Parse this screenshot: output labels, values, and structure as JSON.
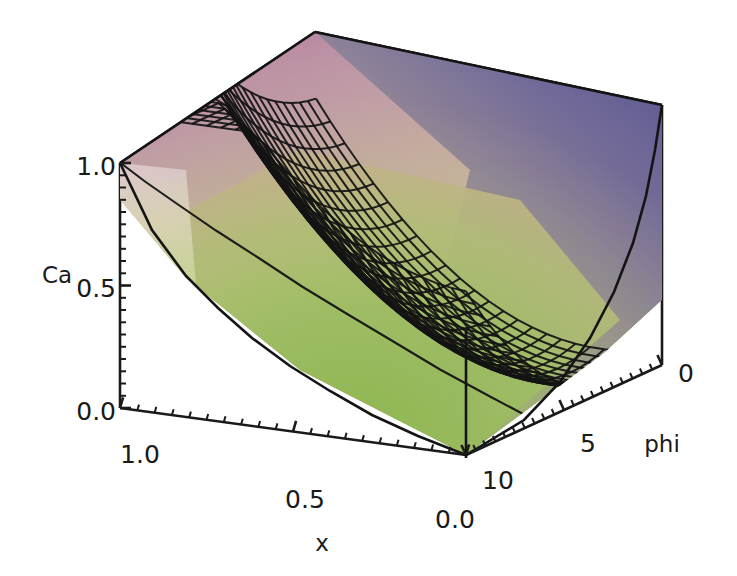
{
  "figure": {
    "background_color": "#ffffff",
    "line_color": "#1a1a1a",
    "mesh_color": "#141414"
  },
  "axes": {
    "vertical": {
      "name": "Ca",
      "label": "Ca",
      "ticks": [
        "1.0",
        "0.5",
        "0.0"
      ],
      "tick_values": [
        1.0,
        0.5,
        0.0
      ],
      "minor_ticks_per_interval": 9
    },
    "depth_left": {
      "name": "x",
      "label": "x",
      "ticks": [
        "1.0",
        "0.5",
        "0.0"
      ],
      "tick_values": [
        1.0,
        0.5,
        0.0
      ],
      "minor_ticks_per_interval": 9
    },
    "depth_right": {
      "name": "phi",
      "label": "phi",
      "ticks": [
        "0",
        "5",
        "10"
      ],
      "tick_values": [
        0,
        5,
        10
      ],
      "minor_ticks_per_interval": 9
    }
  },
  "chart_data": {
    "type": "surface",
    "title": "",
    "xlabel": "x",
    "ylabel": "phi",
    "zlabel": "Ca",
    "xlim": [
      0.0,
      1.0
    ],
    "ylim": [
      0,
      10
    ],
    "zlim": [
      0.0,
      1.2
    ],
    "grid": false,
    "legend": "none",
    "mesh_nx": 24,
    "mesh_ny": 24,
    "colormap": {
      "name": "hue-shift",
      "low": "#a8c662",
      "mid": "#c9a89a",
      "high_back_left": "#b07e9e",
      "high_back_right": "#5c5a96",
      "low_left_edge": "#e6e9c0"
    },
    "surface_corner_values": {
      "x0_phi0": 1.2,
      "x1_phi0": 0.62,
      "x0_phi10": 0.55,
      "x1_phi10": 0.02,
      "minimum": 0.0
    }
  },
  "tick_positions": {
    "ca": [
      {
        "label": "1.0",
        "x": 78,
        "y": 175
      },
      {
        "label": "0.5",
        "x": 78,
        "y": 297
      },
      {
        "label": "0.0",
        "x": 78,
        "y": 420
      }
    ],
    "x": [
      {
        "label": "1.0",
        "x": 140,
        "y": 463
      },
      {
        "label": "0.5",
        "x": 305,
        "y": 508
      },
      {
        "label": "0.0",
        "x": 452,
        "y": 528
      }
    ],
    "phi": [
      {
        "label": "10",
        "x": 496,
        "y": 489
      },
      {
        "label": "5",
        "x": 586,
        "y": 452
      },
      {
        "label": "0",
        "x": 683,
        "y": 382
      }
    ]
  },
  "axis_label_positions": {
    "ca": {
      "x": 38,
      "y": 282
    },
    "x": {
      "x": 320,
      "y": 551
    },
    "phi": {
      "x": 660,
      "y": 451
    }
  }
}
